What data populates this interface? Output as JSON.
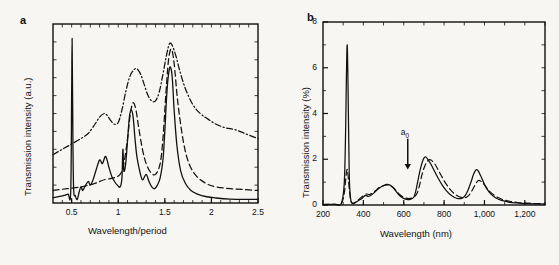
{
  "figure": {
    "background_color": "#f7f6f3",
    "line_color": "#111111"
  },
  "panels": [
    {
      "id": "a",
      "label": "a",
      "chart_data": {
        "type": "line",
        "title": "",
        "xlabel": "Wavelength/period",
        "ylabel": "Transmission intensity (a.u.)",
        "xlim": [
          0.3,
          2.5
        ],
        "ylim": [
          0,
          1
        ],
        "xticks": [
          0.5,
          1,
          1.5,
          2,
          2.5
        ],
        "xtick_labels": [
          "0.5",
          "1",
          "1.5",
          "2",
          "2.5"
        ],
        "yticks": [],
        "ytick_labels": [],
        "grid": false,
        "legend": "none",
        "series": [
          {
            "name": "solid",
            "style": "solid",
            "x": [
              0.3,
              0.4,
              0.46,
              0.49,
              0.5,
              0.505,
              0.51,
              0.52,
              0.54,
              0.56,
              0.58,
              0.6,
              0.62,
              0.65,
              0.68,
              0.7,
              0.73,
              0.76,
              0.8,
              0.83,
              0.86,
              0.88,
              0.9,
              0.93,
              0.96,
              0.99,
              1.02,
              1.04,
              1.05,
              1.06,
              1.08,
              1.1,
              1.12,
              1.14,
              1.16,
              1.18,
              1.2,
              1.23,
              1.26,
              1.3,
              1.33,
              1.36,
              1.39,
              1.42,
              1.45,
              1.48,
              1.5,
              1.52,
              1.54,
              1.56,
              1.58,
              1.6,
              1.63,
              1.67,
              1.72,
              1.78,
              1.85,
              1.95,
              2.05,
              2.2,
              2.4,
              2.5
            ],
            "y": [
              0.03,
              0.04,
              0.05,
              0.06,
              0.6,
              0.92,
              0.6,
              0.1,
              0.04,
              0.02,
              0.06,
              0.09,
              0.07,
              0.1,
              0.12,
              0.1,
              0.13,
              0.18,
              0.24,
              0.22,
              0.26,
              0.24,
              0.2,
              0.15,
              0.12,
              0.1,
              0.09,
              0.14,
              0.3,
              0.18,
              0.22,
              0.35,
              0.48,
              0.52,
              0.48,
              0.36,
              0.26,
              0.18,
              0.13,
              0.16,
              0.12,
              0.09,
              0.08,
              0.1,
              0.14,
              0.24,
              0.4,
              0.6,
              0.72,
              0.76,
              0.7,
              0.52,
              0.32,
              0.18,
              0.11,
              0.07,
              0.05,
              0.035,
              0.028,
              0.022,
              0.02,
              0.02
            ]
          },
          {
            "name": "dashed",
            "style": "dashed",
            "x": [
              0.3,
              0.45,
              0.6,
              0.75,
              0.85,
              0.95,
              1.02,
              1.06,
              1.1,
              1.13,
              1.16,
              1.19,
              1.22,
              1.26,
              1.3,
              1.35,
              1.4,
              1.45,
              1.48,
              1.51,
              1.54,
              1.57,
              1.6,
              1.64,
              1.7,
              1.76,
              1.84,
              1.94,
              2.05,
              2.2,
              2.35,
              2.5
            ],
            "y": [
              0.07,
              0.08,
              0.09,
              0.11,
              0.13,
              0.14,
              0.16,
              0.22,
              0.36,
              0.5,
              0.56,
              0.52,
              0.42,
              0.3,
              0.22,
              0.17,
              0.16,
              0.22,
              0.36,
              0.6,
              0.8,
              0.86,
              0.78,
              0.56,
              0.34,
              0.22,
              0.15,
              0.11,
              0.09,
              0.08,
              0.075,
              0.07
            ]
          },
          {
            "name": "dash-dot",
            "style": "dashdot",
            "x": [
              0.3,
              0.4,
              0.5,
              0.6,
              0.68,
              0.75,
              0.8,
              0.85,
              0.88,
              0.92,
              0.96,
              1.0,
              1.04,
              1.08,
              1.12,
              1.16,
              1.2,
              1.24,
              1.28,
              1.32,
              1.36,
              1.4,
              1.44,
              1.48,
              1.52,
              1.55,
              1.58,
              1.62,
              1.66,
              1.72,
              1.8,
              1.88,
              1.96,
              2.05,
              2.15,
              2.25,
              2.35,
              2.5
            ],
            "y": [
              0.27,
              0.3,
              0.33,
              0.36,
              0.39,
              0.44,
              0.48,
              0.5,
              0.49,
              0.46,
              0.44,
              0.45,
              0.52,
              0.62,
              0.7,
              0.74,
              0.75,
              0.72,
              0.66,
              0.6,
              0.57,
              0.57,
              0.62,
              0.72,
              0.83,
              0.89,
              0.88,
              0.82,
              0.74,
              0.64,
              0.55,
              0.5,
              0.47,
              0.44,
              0.42,
              0.41,
              0.39,
              0.36
            ]
          }
        ]
      }
    },
    {
      "id": "b",
      "label": "b",
      "annotations": [
        {
          "name": "a0-arrow",
          "text_html": "a<sub>0</sub>",
          "x": 620,
          "y_top": 2.9,
          "y_bottom": 1.55
        }
      ],
      "chart_data": {
        "type": "line",
        "title": "",
        "xlabel": "Wavelength (nm)",
        "ylabel": "Transmission intensity (%)",
        "xlim": [
          200,
          1300
        ],
        "ylim": [
          0,
          8
        ],
        "xticks": [
          200,
          400,
          600,
          800,
          1000,
          1200
        ],
        "xtick_labels": [
          "200",
          "400",
          "600",
          "800",
          "1,000",
          "1,200"
        ],
        "yticks": [
          0,
          2,
          4,
          6,
          8
        ],
        "ytick_labels": [
          "0",
          "2",
          "4",
          "6",
          "8"
        ],
        "grid": false,
        "legend": "none",
        "series": [
          {
            "name": "solid",
            "style": "solid",
            "x": [
              200,
              260,
              290,
              305,
              312,
              316,
              320,
              324,
              330,
              336,
              342,
              350,
              360,
              370,
              380,
              395,
              410,
              425,
              440,
              455,
              470,
              485,
              500,
              515,
              530,
              545,
              560,
              575,
              590,
              605,
              620,
              635,
              650,
              660,
              670,
              680,
              690,
              700,
              710,
              720,
              735,
              750,
              770,
              790,
              810,
              830,
              850,
              870,
              890,
              905,
              920,
              935,
              945,
              955,
              962,
              970,
              980,
              995,
              1010,
              1030,
              1055,
              1085,
              1120,
              1160,
              1210,
              1260,
              1300
            ],
            "y": [
              0.02,
              0.03,
              0.05,
              0.9,
              3.2,
              5.6,
              7.0,
              5.2,
              1.4,
              0.35,
              0.1,
              0.06,
              0.1,
              0.16,
              0.22,
              0.3,
              0.42,
              0.38,
              0.44,
              0.55,
              0.68,
              0.78,
              0.84,
              0.9,
              0.88,
              0.78,
              0.62,
              0.46,
              0.34,
              0.27,
              0.24,
              0.26,
              0.34,
              0.62,
              1.05,
              1.48,
              1.82,
              2.05,
              2.1,
              1.98,
              1.78,
              1.52,
              1.18,
              0.88,
              0.64,
              0.46,
              0.34,
              0.28,
              0.3,
              0.42,
              0.68,
              1.05,
              1.32,
              1.5,
              1.55,
              1.48,
              1.3,
              1.0,
              0.74,
              0.5,
              0.32,
              0.2,
              0.13,
              0.09,
              0.06,
              0.05,
              0.04
            ]
          },
          {
            "name": "dashed",
            "style": "dashed",
            "x": [
              200,
              260,
              290,
              305,
              312,
              316,
              320,
              324,
              330,
              336,
              342,
              350,
              360,
              372,
              385,
              400,
              415,
              430,
              445,
              460,
              475,
              490,
              505,
              520,
              535,
              550,
              565,
              580,
              595,
              610,
              625,
              640,
              655,
              668,
              680,
              692,
              705,
              718,
              730,
              742,
              755,
              770,
              790,
              810,
              830,
              850,
              870,
              890,
              905,
              920,
              935,
              950,
              962,
              972,
              985,
              1000,
              1015,
              1035,
              1060,
              1090,
              1125,
              1165,
              1215,
              1265,
              1300
            ],
            "y": [
              0.02,
              0.03,
              0.05,
              0.5,
              1.05,
              1.42,
              1.55,
              1.3,
              0.7,
              0.26,
              0.1,
              0.08,
              0.12,
              0.2,
              0.3,
              0.4,
              0.48,
              0.46,
              0.52,
              0.62,
              0.74,
              0.82,
              0.86,
              0.88,
              0.84,
              0.74,
              0.6,
              0.46,
              0.36,
              0.3,
              0.28,
              0.3,
              0.38,
              0.55,
              0.92,
              1.38,
              1.72,
              1.92,
              1.98,
              1.92,
              1.78,
              1.55,
              1.22,
              0.92,
              0.68,
              0.5,
              0.38,
              0.32,
              0.32,
              0.4,
              0.58,
              0.82,
              1.0,
              1.08,
              1.02,
              0.88,
              0.7,
              0.52,
              0.36,
              0.24,
              0.16,
              0.11,
              0.08,
              0.06,
              0.05
            ]
          }
        ]
      }
    }
  ]
}
